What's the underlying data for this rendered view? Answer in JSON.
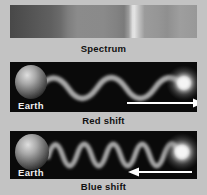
{
  "spectrum": {
    "label": "Spectrum",
    "type": "grayscale-gradient-band",
    "bright_emission_line_position_pct": 66
  },
  "red_shift": {
    "label": "Red shift",
    "earth_label": "Earth",
    "arrow_direction": "right",
    "wave": {
      "cycles": 2.5,
      "relative_wavelength": "long (stretched)"
    }
  },
  "blue_shift": {
    "label": "Blue shift",
    "earth_label": "Earth",
    "arrow_direction": "left",
    "wave": {
      "cycles": 4.75,
      "relative_wavelength": "short (compressed)"
    }
  },
  "colors": {
    "background": "#c3c3c3",
    "panel_background": "#0a0a0a",
    "caption_text": "#111111",
    "panel_text": "#f0f0f0",
    "wave": "#a2a2a2",
    "arrow": "#ffffff"
  }
}
